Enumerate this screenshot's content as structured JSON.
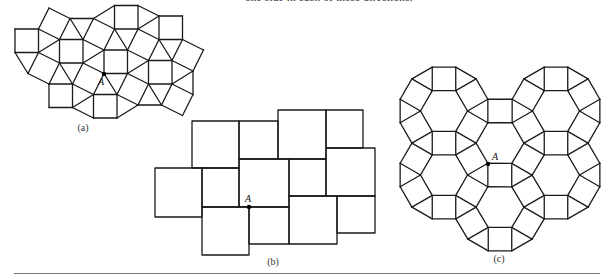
{
  "page": {
    "top_text": "one side in each of these directions.",
    "figures": [
      {
        "id": "a",
        "caption": "(a)",
        "tiling": "snub-square (3.3.4.3.4)",
        "point_label": "A"
      },
      {
        "id": "b",
        "caption": "(b)",
        "tiling": "pythagorean (two square sizes)",
        "point_label": "A"
      },
      {
        "id": "c",
        "caption": "(c)",
        "tiling": "rhombitrihexagonal (3.4.6.4)",
        "point_label": "A"
      }
    ]
  },
  "colors": {
    "ink": "#1a1a1a",
    "rule": "#777777",
    "background": "#ffffff"
  }
}
